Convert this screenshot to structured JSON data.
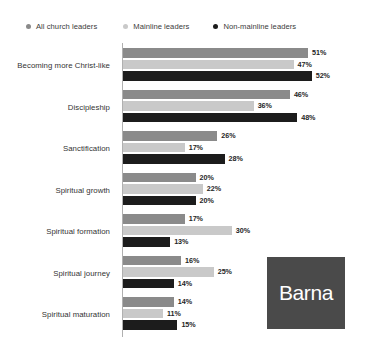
{
  "chart_data": {
    "type": "bar",
    "title": "",
    "orientation": "horizontal",
    "grouped": true,
    "xlabel": "",
    "ylabel": "",
    "xlim": [
      0,
      62
    ],
    "grid": false,
    "legend_position": "top",
    "value_suffix": "%",
    "categories": [
      "Becoming more Christ-like",
      "Discipleship",
      "Sanctification",
      "Spiritual growth",
      "Spiritual formation",
      "Spiritual journey",
      "Spiritual maturation"
    ],
    "series": [
      {
        "name": "All church leaders",
        "color": "#8a8a8a",
        "values": [
          51,
          46,
          26,
          20,
          17,
          16,
          14
        ],
        "labels": [
          "51%",
          "46%",
          "26%",
          "20%",
          "17%",
          "16%",
          "14%"
        ]
      },
      {
        "name": "Mainline leaders",
        "color": "#c9c9c9",
        "values": [
          47,
          36,
          17,
          22,
          30,
          25,
          11
        ],
        "labels": [
          "47%",
          "36%",
          "17%",
          "22%",
          "30%",
          "25%",
          "11%"
        ]
      },
      {
        "name": "Non-mainline leaders",
        "color": "#1c1c1c",
        "values": [
          52,
          48,
          28,
          20,
          13,
          14,
          15
        ],
        "labels": [
          "52%",
          "48%",
          "28%",
          "20%",
          "13%",
          "14%",
          "15%"
        ]
      }
    ]
  },
  "legend": {
    "items": [
      {
        "label": "All church leaders",
        "color": "#8a8a8a",
        "icon": "legend-dot-icon"
      },
      {
        "label": "Mainline leaders",
        "color": "#c9c9c9",
        "icon": "legend-dot-icon"
      },
      {
        "label": "Non-mainline leaders",
        "color": "#1c1c1c",
        "icon": "legend-dot-icon"
      }
    ]
  },
  "logo": {
    "text": "Barna",
    "background": "#4a4a4a",
    "text_color": "#ffffff"
  }
}
